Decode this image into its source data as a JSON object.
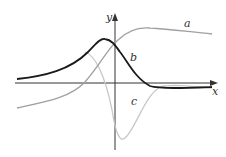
{
  "diagram": {
    "axes": {
      "x_label": "x",
      "y_label": "y"
    },
    "curves": [
      {
        "label": "a",
        "color": "#a0a0a0",
        "description": "increasing sigmoid-like curve rising to a peak then slowly decreasing"
      },
      {
        "label": "b",
        "color": "#1a1a1a",
        "description": "bell-shaped curve peaking just left of y-axis"
      },
      {
        "label": "c",
        "color": "#c8c8c8",
        "description": "curve dipping to a deep minimum just right of y-axis"
      }
    ]
  }
}
